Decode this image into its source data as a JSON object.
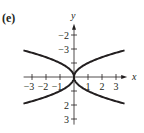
{
  "panel_label": "(e)",
  "chart_data": {
    "type": "line",
    "title": "",
    "xlabel": "x",
    "ylabel": "y",
    "xlim": [
      -3.6,
      3.8
    ],
    "ylim": [
      -3.4,
      3.8
    ],
    "grid": false,
    "legend": null,
    "x_ticks": [
      -3,
      -2,
      -1,
      1,
      2,
      3
    ],
    "y_ticks": [
      -3,
      -2,
      3,
      2
    ],
    "x_tick_labels": [
      "-3",
      "-2",
      "-1",
      "1",
      "2",
      "3"
    ],
    "y_tick_labels": [
      "3",
      "2",
      "-2",
      "-3"
    ],
    "series": [
      {
        "name": "upper-right branch",
        "x": [
          0,
          0.25,
          0.5,
          1,
          1.5,
          2,
          2.5,
          3,
          3.6
        ],
        "y": [
          0,
          0.5,
          0.71,
          1.0,
          1.22,
          1.41,
          1.58,
          1.73,
          1.9
        ]
      },
      {
        "name": "lower-right branch",
        "x": [
          0,
          0.25,
          0.5,
          1,
          1.5,
          2,
          2.5,
          3,
          3.6
        ],
        "y": [
          0,
          -0.5,
          -0.71,
          -1.0,
          -1.22,
          -1.41,
          -1.58,
          -1.73,
          -1.9
        ]
      },
      {
        "name": "upper-left branch",
        "x": [
          0,
          -0.25,
          -0.5,
          -1,
          -1.5,
          -2,
          -2.5,
          -3,
          -3.6
        ],
        "y": [
          0,
          0.5,
          0.71,
          1.0,
          1.22,
          1.41,
          1.58,
          1.73,
          1.9
        ]
      },
      {
        "name": "lower-left branch",
        "x": [
          0,
          -0.25,
          -0.5,
          -1,
          -1.5,
          -2,
          -2.5,
          -3,
          -3.6
        ],
        "y": [
          0,
          -0.5,
          -0.71,
          -1.0,
          -1.22,
          -1.41,
          -1.58,
          -1.73,
          -1.9
        ]
      }
    ]
  }
}
